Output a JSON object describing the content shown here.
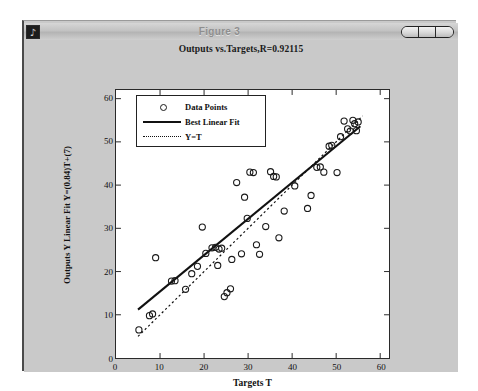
{
  "window": {
    "title": "Figure 3",
    "icon": "matlab-window-icon",
    "controls": [
      {
        "name": "minimize-button",
        "label": ""
      },
      {
        "name": "maximize-button",
        "label": ""
      },
      {
        "name": "close-button",
        "label": ""
      }
    ]
  },
  "colors": {
    "window_bg": "#c9c9c9",
    "plot_bg": "#ffffff",
    "axis": "#2a2a2a",
    "data_marker": "#1a1a1a",
    "fit_line": "#111111",
    "identity_line": "#111111"
  },
  "chart_data": {
    "type": "scatter",
    "title": "Outputs vs.Targets,R=0.92115",
    "xlabel": "Targets T",
    "ylabel": "Outputs Y Linear Fit Y=(0.84)T+(7)",
    "xlim": [
      0,
      62
    ],
    "ylim": [
      0,
      62
    ],
    "xticks": [
      0,
      10,
      20,
      30,
      40,
      50,
      60
    ],
    "yticks": [
      0,
      10,
      20,
      30,
      40,
      50,
      60
    ],
    "grid": false,
    "legend_position": "upper-left",
    "legend": [
      {
        "label": "Data Points",
        "marker": "circle"
      },
      {
        "label": "Best Linear Fit",
        "marker": "solid-line"
      },
      {
        "label": "Y=T",
        "marker": "dotted-line"
      }
    ],
    "regression": {
      "slope": 0.84,
      "intercept": 7,
      "r": 0.92115,
      "equation": "Y=(0.84)T+(7)"
    },
    "series": [
      {
        "name": "Data Points",
        "points": [
          [
            5.2,
            6.5
          ],
          [
            7.6,
            9.8
          ],
          [
            8.3,
            10.2
          ],
          [
            9.0,
            23.2
          ],
          [
            12.6,
            17.8
          ],
          [
            13.4,
            17.9
          ],
          [
            15.8,
            15.9
          ],
          [
            17.2,
            19.5
          ],
          [
            18.5,
            21.2
          ],
          [
            19.6,
            30.3
          ],
          [
            20.4,
            24.2
          ],
          [
            21.8,
            25.5
          ],
          [
            22.6,
            25.6
          ],
          [
            23.1,
            21.4
          ],
          [
            23.4,
            25.2
          ],
          [
            24.0,
            25.4
          ],
          [
            24.6,
            14.2
          ],
          [
            25.2,
            15.1
          ],
          [
            26.0,
            16.0
          ],
          [
            26.3,
            22.8
          ],
          [
            27.4,
            40.6
          ],
          [
            28.5,
            24.1
          ],
          [
            29.2,
            37.2
          ],
          [
            29.8,
            32.3
          ],
          [
            30.4,
            43.0
          ],
          [
            31.2,
            42.9
          ],
          [
            31.9,
            26.2
          ],
          [
            32.6,
            24.0
          ],
          [
            34.0,
            30.4
          ],
          [
            35.1,
            43.1
          ],
          [
            35.8,
            42.0
          ],
          [
            36.4,
            41.9
          ],
          [
            37.0,
            27.8
          ],
          [
            38.2,
            34.0
          ],
          [
            40.6,
            39.8
          ],
          [
            43.5,
            34.6
          ],
          [
            44.3,
            37.6
          ],
          [
            45.6,
            44.1
          ],
          [
            46.4,
            44.2
          ],
          [
            47.2,
            43.0
          ],
          [
            48.4,
            49.0
          ],
          [
            49.0,
            49.2
          ],
          [
            50.2,
            42.9
          ],
          [
            51.0,
            51.2
          ],
          [
            51.8,
            54.8
          ],
          [
            52.6,
            53.0
          ],
          [
            53.2,
            52.5
          ],
          [
            53.8,
            55.0
          ],
          [
            54.2,
            54.2
          ],
          [
            54.6,
            52.6
          ],
          [
            55.0,
            54.6
          ]
        ]
      }
    ],
    "lines": [
      {
        "name": "Best Linear Fit",
        "style": "solid",
        "from": [
          5.0,
          11.2
        ],
        "to": [
          55.5,
          53.6
        ]
      },
      {
        "name": "Y=T",
        "style": "dotted",
        "from": [
          5.0,
          5.0
        ],
        "to": [
          56.0,
          56.0
        ]
      }
    ]
  }
}
